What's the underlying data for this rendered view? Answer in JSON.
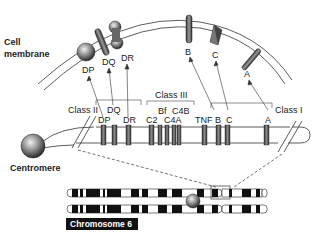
{
  "labels": {
    "cell_membrane_line1": "Cell",
    "cell_membrane_line2": "membrane",
    "centromere": "Centromere",
    "chromosome": "Chromosome 6"
  },
  "membrane_proteins": [
    {
      "name": "DP",
      "shape": "sphere"
    },
    {
      "name": "DQ",
      "shape": "rod"
    },
    {
      "name": "DR",
      "shape": "dumbbell"
    },
    {
      "name": "B",
      "shape": "rod"
    },
    {
      "name": "C",
      "shape": "diamond"
    },
    {
      "name": "A",
      "shape": "cross-rod"
    }
  ],
  "classes": {
    "class_ii": {
      "label": "Class II",
      "bracket_label": "DQ"
    },
    "class_iii": {
      "label": "Class III"
    },
    "class_i": {
      "label": "Class I"
    }
  },
  "genes": {
    "dp": "DP",
    "dq": "DQ",
    "dr": "DR",
    "c2": "C2",
    "bf": "Bf",
    "c4a": "C4A",
    "c4b": "C4B",
    "tnf": "TNF",
    "b": "B",
    "c": "C",
    "a": "A"
  },
  "colors": {
    "band": "#555555",
    "outline": "#333333",
    "chrom_dark": "#111111",
    "chrom_label_bg": "#111111"
  }
}
